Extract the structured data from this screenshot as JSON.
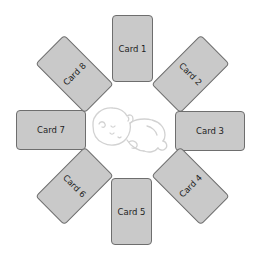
{
  "diagram": {
    "cards": [
      {
        "label": "Card 1",
        "position": "top"
      },
      {
        "label": "Card 2",
        "position": "top-right"
      },
      {
        "label": "Card 3",
        "position": "right"
      },
      {
        "label": "Card 4",
        "position": "bottom-right"
      },
      {
        "label": "Card 5",
        "position": "bottom"
      },
      {
        "label": "Card 6",
        "position": "bottom-left"
      },
      {
        "label": "Card 7",
        "position": "left"
      },
      {
        "label": "Card 8",
        "position": "top-left"
      }
    ],
    "center_icon": "sleeping-baby-icon",
    "colors": {
      "card_fill": "#c9c9c9",
      "card_border": "#6e6e6e",
      "icon_stroke": "#d4d4d4",
      "background": "#ffffff"
    }
  }
}
